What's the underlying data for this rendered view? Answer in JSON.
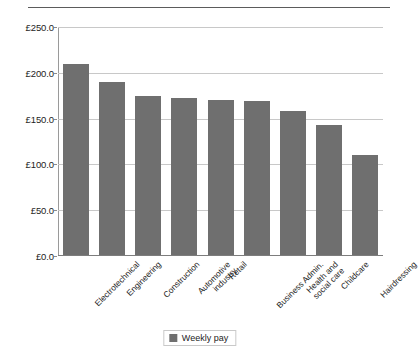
{
  "chart_data": {
    "type": "bar",
    "title": "",
    "subtitle": "",
    "xlabel": "",
    "ylabel": "",
    "ylim": [
      0,
      250
    ],
    "ytick_values": [
      250,
      200,
      150,
      100,
      50,
      0
    ],
    "ytick_labels": [
      "£250.0",
      "£200.0",
      "£150.0",
      "£100.0",
      "£50.0",
      "£0.0"
    ],
    "grid": true,
    "grid_axis": "y",
    "legend_position": "bottom-center",
    "bar_color": "#6f6f6f",
    "categories": [
      "Electrotechnical",
      "Engineering",
      "Construction",
      "Automotive industry",
      "Retail",
      "Business Admin.",
      "Health and social care",
      "Childcare",
      "Hairdressing"
    ],
    "category_lines": [
      [
        "Electrotechnical"
      ],
      [
        "Engineering"
      ],
      [
        "Construction"
      ],
      [
        "Automotive",
        "industry"
      ],
      [
        "Retail"
      ],
      [
        "Business Admin."
      ],
      [
        "Health and",
        "social care"
      ],
      [
        "Childcare"
      ],
      [
        "Hairdressing"
      ]
    ],
    "series": [
      {
        "name": "Weekly pay",
        "color": "#6f6f6f",
        "values": [
          210,
          190,
          175,
          172,
          170,
          169,
          158,
          143,
          110
        ]
      }
    ]
  },
  "legend": {
    "entries": [
      {
        "label": "Weekly pay",
        "color": "#6f6f6f"
      }
    ]
  }
}
